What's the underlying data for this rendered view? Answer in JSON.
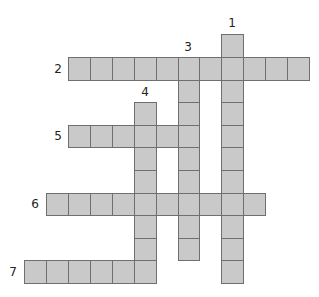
{
  "puzzle": {
    "type": "crossword",
    "cell_fill": "#c9c9c9",
    "cell_border": "#6f6f6f",
    "grid": {
      "origin_x": 68,
      "origin_y": 57,
      "cell_w": 21.9,
      "cell_h": 22.6
    },
    "entries": [
      {
        "number": "1",
        "direction": "down",
        "row": -1,
        "col": 7,
        "length": 11,
        "label_x": 225,
        "label_y": 17
      },
      {
        "number": "2",
        "direction": "across",
        "row": 0,
        "col": 0,
        "length": 11,
        "label_x": 51,
        "label_y": 63
      },
      {
        "number": "3",
        "direction": "down",
        "row": 0,
        "col": 5,
        "length": 9,
        "label_x": 181,
        "label_y": 41
      },
      {
        "number": "4",
        "direction": "down",
        "row": 2,
        "col": 3,
        "length": 8,
        "label_x": 138,
        "label_y": 86
      },
      {
        "number": "5",
        "direction": "across",
        "row": 3,
        "col": 0,
        "length": 6,
        "label_x": 51,
        "label_y": 130
      },
      {
        "number": "6",
        "direction": "across",
        "row": 6,
        "col": -1,
        "length": 10,
        "label_x": 28,
        "label_y": 198
      },
      {
        "number": "7",
        "direction": "across",
        "row": 9,
        "col": -2,
        "length": 6,
        "label_x": 6,
        "label_y": 266
      }
    ]
  }
}
